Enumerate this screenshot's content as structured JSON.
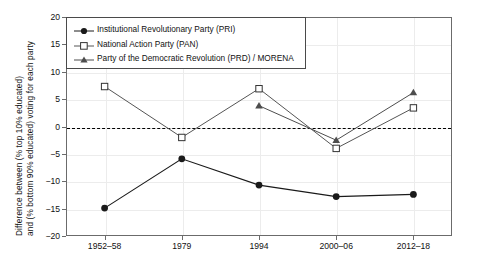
{
  "chart_data": {
    "type": "line",
    "title": "",
    "xlabel": "",
    "ylabel_line1": "Difference between (% top 10% educated)",
    "ylabel_line2": "and (% bottom 90% educated) voting for each party",
    "categories": [
      "1952–58",
      "1979",
      "1994",
      "2000–06",
      "2012–18"
    ],
    "ylim": [
      -20,
      20
    ],
    "yticks": [
      20,
      15,
      10,
      5,
      0,
      -5,
      -10,
      -15,
      -20
    ],
    "yticklabels": [
      "20",
      "15",
      "10",
      "5",
      "0",
      "−5",
      "−10",
      "−15",
      "−20"
    ],
    "grid": true,
    "zero_reference_line": true,
    "legend_position": "top-left",
    "series": [
      {
        "name": "Institutional Revolutionary Party (PRI)",
        "marker": "filled-circle",
        "color": "#1a1a1a",
        "values": [
          -14.9,
          -5.9,
          -10.7,
          -12.8,
          -12.4
        ]
      },
      {
        "name": "National Action Party (PAN)",
        "marker": "open-square",
        "color": "#555555",
        "values": [
          7.3,
          -2.0,
          6.9,
          -4.0,
          3.4
        ]
      },
      {
        "name": "Party of the Democratic Revolution (PRD) / MORENA",
        "marker": "filled-triangle",
        "color": "#4d4d4d",
        "values": [
          null,
          null,
          3.8,
          -2.5,
          6.2
        ]
      }
    ]
  }
}
